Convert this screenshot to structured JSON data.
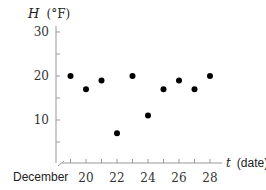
{
  "chart_data": {
    "type": "scatter",
    "title": "",
    "ylabel_var": "H",
    "ylabel_unit": "(°F)",
    "xlabel_var": "t",
    "xlabel_unit": "(date)",
    "x_prefix_label": "December",
    "xlim": [
      18,
      28.5
    ],
    "ylim": [
      0,
      30
    ],
    "x_ticks": [
      19,
      20,
      21,
      22,
      23,
      24,
      25,
      26,
      27,
      28
    ],
    "x_tick_labels": [
      20,
      22,
      24,
      26,
      28
    ],
    "y_ticks": [
      5,
      10,
      15,
      20,
      25,
      30
    ],
    "y_tick_labels": [
      10,
      20,
      30
    ],
    "grid": false,
    "axis_break": true,
    "x": [
      19,
      20,
      21,
      22,
      23,
      24,
      25,
      26,
      27,
      28
    ],
    "values": [
      20,
      17,
      19,
      7,
      20,
      11,
      17,
      19,
      17,
      20
    ],
    "point_color": "#000000",
    "axis_color": "#999999"
  }
}
